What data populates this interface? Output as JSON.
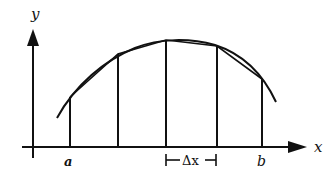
{
  "diagram": {
    "axes": {
      "x_label": "x",
      "y_label": "y"
    },
    "interval": {
      "start_label": "a",
      "end_label": "b",
      "step_label": "Δx"
    },
    "partition_points": 5,
    "colors": {
      "stroke": "#111111",
      "background": "#ffffff"
    }
  }
}
